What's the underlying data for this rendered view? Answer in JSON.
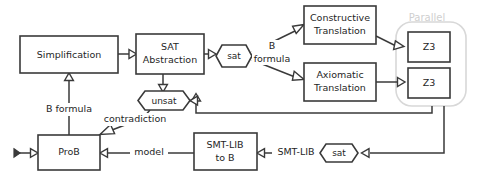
{
  "diagram": {
    "colors": {
      "stroke": "#3a3a3a",
      "text": "#1f1f1f",
      "group_stroke": "#d8d8d8",
      "group_text": "#cfcfcf",
      "background": "#ffffff"
    },
    "nodes": {
      "simplification": {
        "label": "Simplification",
        "shape": "rectangle"
      },
      "sat_abstraction": {
        "label_line1": "SAT",
        "label_line2": "Abstraction",
        "shape": "rectangle"
      },
      "sat_token_top": {
        "label": "sat",
        "shape": "hexagon"
      },
      "constructive_translation": {
        "label_line1": "Constructive",
        "label_line2": "Translation",
        "shape": "rectangle"
      },
      "axiomatic_translation": {
        "label_line1": "Axiomatic",
        "label_line2": "Translation",
        "shape": "rectangle"
      },
      "z3_top": {
        "label": "Z3",
        "shape": "rectangle"
      },
      "z3_bottom": {
        "label": "Z3",
        "shape": "rectangle"
      },
      "parallel_group": {
        "label": "Parallel",
        "shape": "rounded-group"
      },
      "unsat_token": {
        "label": "unsat",
        "shape": "hexagon"
      },
      "prob": {
        "label": "ProB",
        "shape": "rectangle"
      },
      "smtlib_to_b": {
        "label_line1": "SMT-LIB",
        "label_line2": "to B",
        "shape": "rectangle"
      },
      "sat_token_bottom": {
        "label": "sat",
        "shape": "hexagon"
      }
    },
    "edge_labels": {
      "b_formula_right_line1": "B",
      "b_formula_right_line2": "formula",
      "b_formula_left": "B formula",
      "contradiction": "contradiction",
      "model": "model",
      "smtlib": "SMT-LIB"
    }
  }
}
